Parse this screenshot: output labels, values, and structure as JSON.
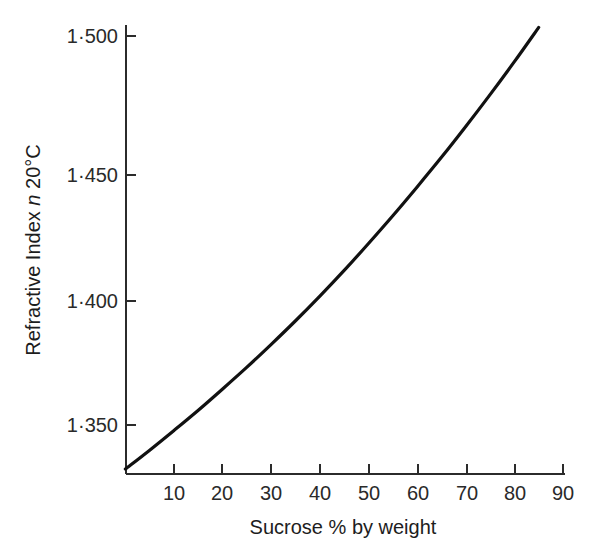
{
  "chart_data": {
    "type": "line",
    "title": "",
    "subtitle": "",
    "xlabel": "Sucrose % by weight",
    "ylabel_parts": {
      "lead": "Refractive Index ",
      "symbol": "n",
      "trail": " 20°C"
    },
    "ylabel": "Refractive Index n 20°C",
    "xlim": [
      0,
      90
    ],
    "ylim": [
      1.333,
      1.504
    ],
    "grid": false,
    "legend": null,
    "xticks": [
      10,
      20,
      30,
      40,
      50,
      60,
      70,
      80,
      90
    ],
    "xticklabels": [
      "10",
      "20",
      "30",
      "40",
      "50",
      "60",
      "70",
      "80",
      "90"
    ],
    "yticks": [
      1.35,
      1.4,
      1.45,
      1.5
    ],
    "yticklabels": [
      "1·350",
      "1·400",
      "1·450",
      "1·500"
    ],
    "series": [
      {
        "name": "Refractive index of sucrose solution",
        "color": "#111111",
        "x": [
          0,
          5,
          10,
          15,
          20,
          25,
          30,
          35,
          40,
          45,
          50,
          55,
          60,
          65,
          70,
          75,
          80,
          85
        ],
        "values": [
          1.333,
          1.3403,
          1.3479,
          1.3557,
          1.3639,
          1.3723,
          1.3811,
          1.3902,
          1.3997,
          1.4096,
          1.42,
          1.4307,
          1.4418,
          1.4532,
          1.4651,
          1.4774,
          1.4901,
          1.5033
        ]
      }
    ]
  },
  "axes": {
    "x_tick_direction": "inward",
    "y_tick_direction": "inward",
    "axis_color": "#2b2b2b"
  }
}
